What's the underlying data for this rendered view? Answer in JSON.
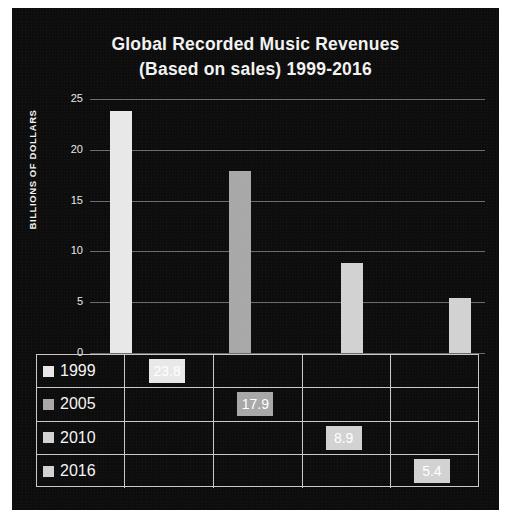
{
  "chart_data": {
    "type": "bar",
    "title": "Global Recorded Music Revenues (Based on sales) 1999-2016",
    "title_line1": "Global Recorded Music Revenues",
    "title_line2": "(Based on sales) 1999-2016",
    "xlabel": "",
    "ylabel": "BILLIONS OF DOLLARS",
    "categories": [
      "1999",
      "2005",
      "2010",
      "2016"
    ],
    "values": [
      23.8,
      17.9,
      8.9,
      5.4
    ],
    "value_labels": [
      "23.8",
      "17.9",
      "8.9",
      "5.4"
    ],
    "ylim": [
      0,
      25
    ],
    "yticks": [
      0,
      5,
      10,
      15,
      20,
      25
    ],
    "ytick_labels": [
      "0",
      "5",
      "10",
      "15",
      "20",
      "25"
    ],
    "grid": true,
    "legend": "data-table",
    "bar_colors": [
      "#e8e8e8",
      "#a8a8a8",
      "#d2d2d2",
      "#d2d2d2"
    ],
    "series_name": "Revenue"
  },
  "colors": {
    "page_background": "#ffffff",
    "plot_background": "#0d0d0d",
    "text": "#f2f2f2",
    "gridline": "#7d7d7d",
    "table_border": "#c9c9c9",
    "value_label_text": "#ffffff"
  },
  "table": {
    "rows": [
      {
        "year": "1999",
        "swatch": "#e8e8e8",
        "value": "23.8",
        "column": 0
      },
      {
        "year": "2005",
        "swatch": "#a8a8a8",
        "value": "17.9",
        "column": 1
      },
      {
        "year": "2010",
        "swatch": "#d2d2d2",
        "value": "8.9",
        "column": 2
      },
      {
        "year": "2016",
        "swatch": "#d2d2d2",
        "value": "5.4",
        "column": 3
      }
    ]
  }
}
